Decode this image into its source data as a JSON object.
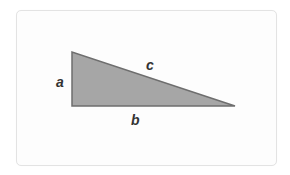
{
  "diagram": {
    "type": "right-triangle",
    "labels": {
      "side_a": "a",
      "side_b": "b",
      "side_c": "c"
    },
    "colors": {
      "fill": "#a6a6a6",
      "stroke": "#6e6e6e",
      "label": "#333333",
      "card_border": "#e3e3e3",
      "card_background": "#fdfdfd"
    }
  }
}
